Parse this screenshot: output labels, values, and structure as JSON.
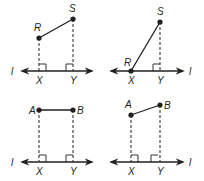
{
  "figure": {
    "colors": {
      "ink": "#231f20",
      "background": "#ffffff"
    },
    "panels": [
      {
        "id": "panel-1",
        "line_label": "l",
        "points": [
          {
            "name": "R",
            "x": 39,
            "y": 38,
            "label_x": 34,
            "label_y": 31
          },
          {
            "name": "S",
            "x": 73,
            "y": 19,
            "label_x": 69,
            "label_y": 12
          }
        ],
        "foot_labels": [
          {
            "name": "X",
            "x": 36,
            "y": 84
          },
          {
            "name": "Y",
            "x": 70,
            "y": 84
          }
        ],
        "line_y": 71,
        "line_label_pos": {
          "x": 11,
          "y": 75
        }
      },
      {
        "id": "panel-2",
        "line_label": "l",
        "points": [
          {
            "name": "S",
            "x": 160,
            "y": 22,
            "label_x": 157,
            "label_y": 15
          },
          {
            "name": "R",
            "x": 131,
            "y": 71,
            "label_x": 124,
            "label_y": 66
          }
        ],
        "foot_labels": [
          {
            "name": "X",
            "x": 128,
            "y": 84
          },
          {
            "name": "Y",
            "x": 157,
            "y": 84
          }
        ],
        "line_y": 71,
        "line_label_pos": {
          "x": 189,
          "y": 75
        }
      },
      {
        "id": "panel-3",
        "line_label": "l",
        "points": [
          {
            "name": "A",
            "x": 39,
            "y": 110,
            "label_x": 29,
            "label_y": 114
          },
          {
            "name": "B",
            "x": 73,
            "y": 110,
            "label_x": 77,
            "label_y": 114
          }
        ],
        "foot_labels": [
          {
            "name": "X",
            "x": 36,
            "y": 175
          },
          {
            "name": "Y",
            "x": 70,
            "y": 175
          }
        ],
        "line_y": 162,
        "line_label_pos": {
          "x": 11,
          "y": 166
        }
      },
      {
        "id": "panel-4",
        "line_label": "l",
        "points": [
          {
            "name": "A",
            "x": 131,
            "y": 115,
            "label_x": 125,
            "label_y": 108
          },
          {
            "name": "B",
            "x": 160,
            "y": 105,
            "label_x": 164,
            "label_y": 109
          }
        ],
        "foot_labels": [
          {
            "name": "X",
            "x": 128,
            "y": 175
          },
          {
            "name": "Y",
            "x": 157,
            "y": 175
          }
        ],
        "line_y": 162,
        "line_label_pos": {
          "x": 189,
          "y": 166
        }
      }
    ]
  }
}
